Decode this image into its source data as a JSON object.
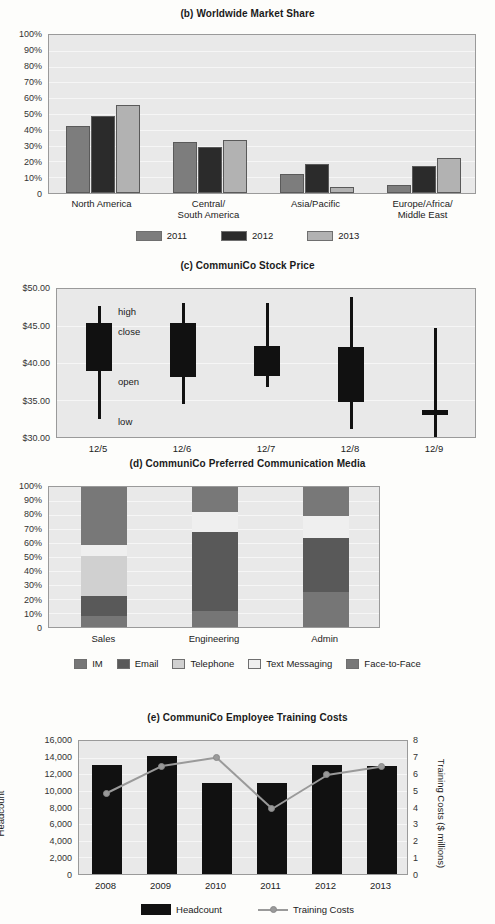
{
  "chart_data": [
    {
      "id": "b",
      "type": "bar",
      "title": "(b) Worldwide Market Share",
      "xlabel": "",
      "ylabel": "",
      "ylim": [
        0,
        100
      ],
      "yticks": [
        "0",
        "10%",
        "20%",
        "30%",
        "40%",
        "50%",
        "60%",
        "70%",
        "80%",
        "90%",
        "100%"
      ],
      "grid": true,
      "legend_position": "bottom",
      "categories": [
        "North America",
        "Central/\nSouth America",
        "Asia/Pacific",
        "Europe/Africa/\nMiddle East"
      ],
      "category_lines": [
        [
          "North America"
        ],
        [
          "Central/",
          "South America"
        ],
        [
          "Asia/Pacific"
        ],
        [
          "Europe/Africa/",
          "Middle East"
        ]
      ],
      "series": [
        {
          "name": "2011",
          "color": "#7d7d7d",
          "values": [
            42,
            32,
            12,
            5
          ]
        },
        {
          "name": "2012",
          "color": "#2b2b2b",
          "values": [
            48,
            29,
            18,
            17
          ]
        },
        {
          "name": "2013",
          "color": "#b2b2b2",
          "values": [
            55,
            33,
            4,
            22
          ]
        }
      ]
    },
    {
      "id": "c",
      "type": "candlestick",
      "title": "(c) CommuniCo Stock Price",
      "xlabel": "",
      "ylabel": "",
      "ylim": [
        30,
        50
      ],
      "yticks": [
        "$30.00",
        "$35.00",
        "$40.00",
        "$45.00",
        "$50.00"
      ],
      "grid": true,
      "annotations": [
        "high",
        "close",
        "open",
        "low"
      ],
      "categories": [
        "12/5",
        "12/6",
        "12/7",
        "12/8",
        "12/9"
      ],
      "points": [
        {
          "date": "12/5",
          "open": 39.1,
          "close": 45.5,
          "high": 47.8,
          "low": 32.7
        },
        {
          "date": "12/6",
          "open": 38.3,
          "close": 45.5,
          "high": 48.2,
          "low": 34.7
        },
        {
          "date": "12/7",
          "open": 38.4,
          "close": 42.4,
          "high": 48.1,
          "low": 36.9
        },
        {
          "date": "12/8",
          "open": 34.9,
          "close": 42.3,
          "high": 49.0,
          "low": 31.4
        },
        {
          "date": "12/9",
          "open": 33.2,
          "close": 33.9,
          "high": 44.8,
          "low": 30.0
        }
      ]
    },
    {
      "id": "d",
      "type": "bar",
      "stacked": true,
      "title": "(d) CommuniCo Preferred Communication Media",
      "xlabel": "",
      "ylabel": "",
      "ylim": [
        0,
        100
      ],
      "yticks": [
        "0",
        "10%",
        "20%",
        "30%",
        "40%",
        "50%",
        "60%",
        "70%",
        "80%",
        "90%",
        "100%"
      ],
      "grid": true,
      "legend_position": "bottom",
      "categories": [
        "Sales",
        "Engineering",
        "Admin"
      ],
      "series": [
        {
          "name": "IM",
          "color": "#767676",
          "values": [
            8,
            11,
            25
          ]
        },
        {
          "name": "Email",
          "color": "#595959",
          "values": [
            14,
            56,
            38
          ]
        },
        {
          "name": "Telephone",
          "color": "#d0d0d0",
          "values": [
            28,
            0,
            0
          ]
        },
        {
          "name": "Text Messaging",
          "color": "#efefef",
          "values": [
            8,
            14,
            15
          ]
        },
        {
          "name": "Face-to-Face",
          "color": "#787878",
          "values": [
            42,
            19,
            22
          ]
        }
      ]
    },
    {
      "id": "e",
      "type": "bar",
      "combo": "line",
      "title": "(e) CommuniCo Employee Training Costs",
      "xlabel": "",
      "ylabel": "Headcount",
      "y2label": "Training Costs ($ millions)",
      "ylim": [
        0,
        16000
      ],
      "y2lim": [
        0,
        8
      ],
      "yticks": [
        "0",
        "2,000",
        "4,000",
        "6,000",
        "8,000",
        "10,000",
        "12,000",
        "14,000",
        "16,000"
      ],
      "y2ticks": [
        "0",
        "1",
        "2",
        "3",
        "4",
        "5",
        "6",
        "7",
        "8"
      ],
      "grid": true,
      "legend_position": "bottom",
      "categories": [
        "2008",
        "2009",
        "2010",
        "2011",
        "2012",
        "2013"
      ],
      "series": [
        {
          "name": "Headcount",
          "type": "bar",
          "color": "#111111",
          "values": [
            12900,
            13950,
            10800,
            10800,
            12900,
            12850
          ]
        },
        {
          "name": "Training Costs",
          "type": "line",
          "color": "#9a9a9a",
          "values": [
            4.9,
            6.5,
            7.0,
            4.0,
            6.0,
            6.5
          ]
        }
      ]
    }
  ]
}
